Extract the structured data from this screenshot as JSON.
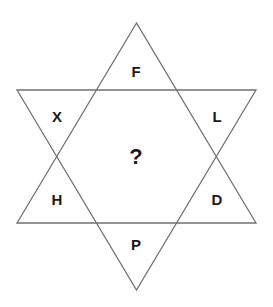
{
  "puzzle": {
    "type": "star-of-david-letter-puzzle",
    "center_label": "?",
    "points": {
      "top": "F",
      "upper_left": "X",
      "upper_right": "L",
      "lower_left": "H",
      "lower_right": "D",
      "bottom": "P"
    }
  },
  "colors": {
    "background": "#ffffff",
    "stroke": "#707070",
    "text": "#1a1a1a"
  }
}
